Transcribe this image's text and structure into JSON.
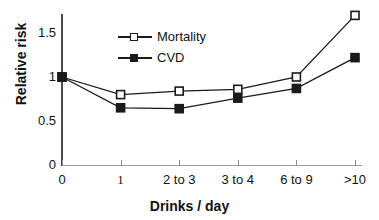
{
  "chart_data": {
    "type": "line",
    "title": "",
    "xlabel": "Drinks / day",
    "ylabel": "Relative risk",
    "categories": [
      "0",
      "1",
      "2 to 3",
      "3 to 4",
      "6 to 9",
      ">10"
    ],
    "series": [
      {
        "name": "Mortality",
        "marker": "open-square",
        "values": [
          1.0,
          0.8,
          0.84,
          0.86,
          1.0,
          1.7
        ]
      },
      {
        "name": "CVD",
        "marker": "filled-square",
        "values": [
          1.0,
          0.65,
          0.64,
          0.76,
          0.87,
          1.22
        ]
      }
    ],
    "ylim": [
      0,
      1.75
    ],
    "yticks": [
      "0",
      "0.5",
      "1",
      "1.5"
    ],
    "ytick_values": [
      0,
      0.5,
      1,
      1.5
    ],
    "grid": false,
    "legend_position": "upper-left-inside",
    "line_color": "#1a1a1a",
    "axis_color": "#4a4a4a",
    "background_color": "#ffffff"
  },
  "axes": {
    "y_title": "Relative risk",
    "x_title": "Drinks / day"
  },
  "legend": {
    "items": [
      {
        "label": "Mortality"
      },
      {
        "label": "CVD"
      }
    ]
  }
}
